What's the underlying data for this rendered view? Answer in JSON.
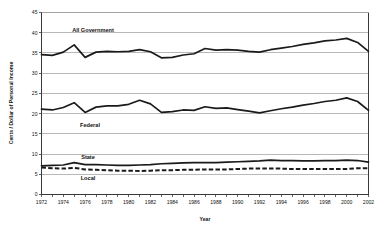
{
  "chart_data": {
    "type": "line",
    "title": "",
    "xlabel": "Year",
    "ylabel": "Cents / Dollar of Personal Income",
    "xlim": [
      1972,
      2002
    ],
    "ylim": [
      0,
      45
    ],
    "ytick_step": 5,
    "xtick_step": 2,
    "grid": true,
    "legend_position": "inline-annotations",
    "x": [
      1972,
      1973,
      1974,
      1975,
      1976,
      1977,
      1978,
      1979,
      1980,
      1981,
      1982,
      1983,
      1984,
      1985,
      1986,
      1987,
      1988,
      1989,
      1990,
      1991,
      1992,
      1993,
      1994,
      1995,
      1996,
      1997,
      1998,
      1999,
      2000,
      2001,
      2002
    ],
    "xticklabels": [
      "1972",
      "1974",
      "1976",
      "1978",
      "1980",
      "1982",
      "1984",
      "1986",
      "1988",
      "1990",
      "1992",
      "1994",
      "1996",
      "1998",
      "2000",
      "2002"
    ],
    "yticklabels": [
      "0",
      "5",
      "10",
      "15",
      "20",
      "25",
      "30",
      "35",
      "40",
      "45"
    ],
    "series": [
      {
        "name": "All Government",
        "style": "solid",
        "annotation": "All Government",
        "values": [
          34.6,
          34.4,
          35.2,
          37.0,
          33.9,
          35.2,
          35.4,
          35.3,
          35.4,
          35.8,
          35.3,
          33.8,
          33.9,
          34.5,
          34.8,
          36.1,
          35.7,
          35.8,
          35.7,
          35.4,
          35.2,
          35.8,
          36.2,
          36.6,
          37.1,
          37.5,
          38.0,
          38.2,
          38.6,
          37.6,
          35.4
        ]
      },
      {
        "name": "Federal",
        "style": "solid",
        "annotation": "Federal",
        "values": [
          21.1,
          20.9,
          21.5,
          22.7,
          20.3,
          21.6,
          21.9,
          21.9,
          22.3,
          23.3,
          22.4,
          20.3,
          20.5,
          20.9,
          20.8,
          21.7,
          21.3,
          21.4,
          21.0,
          20.6,
          20.2,
          20.7,
          21.2,
          21.6,
          22.1,
          22.5,
          23.0,
          23.3,
          23.9,
          23.0,
          20.8
        ]
      },
      {
        "name": "State",
        "style": "solid",
        "annotation": "State",
        "values": [
          7.1,
          7.2,
          7.3,
          7.9,
          7.4,
          7.4,
          7.3,
          7.2,
          7.2,
          7.3,
          7.4,
          7.6,
          7.7,
          7.8,
          7.9,
          7.9,
          7.9,
          8.0,
          8.1,
          8.2,
          8.3,
          8.5,
          8.4,
          8.4,
          8.3,
          8.3,
          8.4,
          8.4,
          8.5,
          8.4,
          8.0
        ]
      },
      {
        "name": "Local",
        "style": "dashed",
        "annotation": "Local",
        "values": [
          6.7,
          6.5,
          6.4,
          6.6,
          6.2,
          6.1,
          6.0,
          5.9,
          5.9,
          5.8,
          5.9,
          6.0,
          6.0,
          6.1,
          6.1,
          6.2,
          6.2,
          6.2,
          6.3,
          6.4,
          6.4,
          6.4,
          6.4,
          6.3,
          6.3,
          6.3,
          6.3,
          6.3,
          6.3,
          6.5,
          6.5
        ]
      }
    ]
  }
}
